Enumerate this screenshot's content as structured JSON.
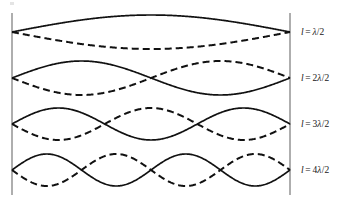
{
  "figure": {
    "background_color": "#ffffff",
    "boundary_color": "#9a9a9a",
    "curve_color": "#111111",
    "label_color": "#171717"
  },
  "geometry": {
    "left_wall_x": 12,
    "right_wall_x": 290,
    "wall_top_y": 13,
    "wall_bottom_y": 195,
    "string_length_px": 278
  },
  "chart_data": {
    "type": "line",
    "xlabel": "",
    "ylabel": "",
    "grid": false,
    "legend": "none",
    "xlim": [
      0,
      1
    ],
    "ylim": [
      -1,
      1
    ],
    "annotations": [
      "l = λ/2",
      "l = 2λ/2",
      "l = 3λ/2",
      "l = 4λ/2"
    ],
    "series": [
      {
        "name": "mode-1-solid",
        "harmonic": 1,
        "phase": "positive",
        "style": "solid",
        "half_wavelengths": 1,
        "interior_nodes": 0,
        "antinodes": 1,
        "baseline_y": 32,
        "amplitude_px": 17
      },
      {
        "name": "mode-1-dashed",
        "harmonic": 1,
        "phase": "negative",
        "style": "dashed",
        "half_wavelengths": 1,
        "interior_nodes": 0,
        "antinodes": 1,
        "baseline_y": 32,
        "amplitude_px": 17
      },
      {
        "name": "mode-2-solid",
        "harmonic": 2,
        "phase": "positive",
        "style": "solid",
        "half_wavelengths": 2,
        "interior_nodes": 1,
        "antinodes": 2,
        "baseline_y": 78,
        "amplitude_px": 17
      },
      {
        "name": "mode-2-dashed",
        "harmonic": 2,
        "phase": "negative",
        "style": "dashed",
        "half_wavelengths": 2,
        "interior_nodes": 1,
        "antinodes": 2,
        "baseline_y": 78,
        "amplitude_px": 17
      },
      {
        "name": "mode-3-solid",
        "harmonic": 3,
        "phase": "positive",
        "style": "solid",
        "half_wavelengths": 3,
        "interior_nodes": 2,
        "antinodes": 3,
        "baseline_y": 124,
        "amplitude_px": 16
      },
      {
        "name": "mode-3-dashed",
        "harmonic": 3,
        "phase": "negative",
        "style": "dashed",
        "half_wavelengths": 3,
        "interior_nodes": 2,
        "antinodes": 3,
        "baseline_y": 124,
        "amplitude_px": 16
      },
      {
        "name": "mode-4-solid",
        "harmonic": 4,
        "phase": "positive",
        "style": "solid",
        "half_wavelengths": 4,
        "interior_nodes": 3,
        "antinodes": 4,
        "baseline_y": 170,
        "amplitude_px": 16
      },
      {
        "name": "mode-4-dashed",
        "harmonic": 4,
        "phase": "negative",
        "style": "dashed",
        "half_wavelengths": 4,
        "interior_nodes": 3,
        "antinodes": 4,
        "baseline_y": 170,
        "amplitude_px": 16
      }
    ]
  },
  "labels": [
    {
      "id": "mode-1",
      "text": "l = λ/2",
      "symbol": "l",
      "equals": "=",
      "coefficient": "",
      "lambda": "λ",
      "fraction": "/2",
      "x": 301,
      "y": 27
    },
    {
      "id": "mode-2",
      "text": "l = 2λ/2",
      "symbol": "l",
      "equals": "=",
      "coefficient": "2",
      "lambda": "λ",
      "fraction": "/2",
      "x": 301,
      "y": 73
    },
    {
      "id": "mode-3",
      "text": "l = 3λ/2",
      "symbol": "l",
      "equals": "=",
      "coefficient": "3",
      "lambda": "λ",
      "fraction": "/2",
      "x": 301,
      "y": 119
    },
    {
      "id": "mode-4",
      "text": "l = 4λ/2",
      "symbol": "l",
      "equals": "=",
      "coefficient": "4",
      "lambda": "λ",
      "fraction": "/2",
      "x": 301,
      "y": 165
    }
  ]
}
